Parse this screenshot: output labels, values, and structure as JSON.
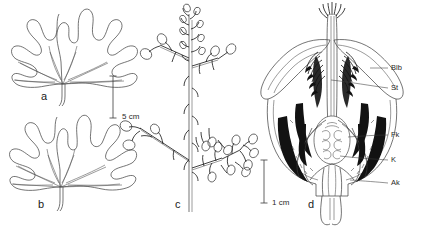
{
  "figure": {
    "kind": "botanical-line-drawing-plate",
    "background_color": "#ffffff",
    "ink_color": "#2a2a2a",
    "panels": [
      {
        "letter": "a",
        "subject": "palmate leaf with five broad blunt lobes",
        "letter_x": 41,
        "letter_y": 91
      },
      {
        "letter": "b",
        "subject": "palmate leaf with five narrow pointed lobes",
        "letter_x": 38,
        "letter_y": 199
      },
      {
        "letter": "c",
        "subject": "branched inflorescence panicle with flower buds",
        "letter_x": 175,
        "letter_y": 199
      },
      {
        "letter": "d",
        "subject": "longitudinal section of flower",
        "letter_x": 308,
        "letter_y": 199
      }
    ],
    "scale_bars": [
      {
        "label": "5 cm",
        "label_x": 122,
        "label_y": 113,
        "bar_x": 113,
        "bar_top": 76,
        "bar_bottom": 118,
        "applies_to": "a,b"
      },
      {
        "label": "1 cm",
        "label_x": 272,
        "label_y": 199,
        "bar_x": 264,
        "bar_top": 160,
        "bar_bottom": 203,
        "applies_to": "d"
      }
    ],
    "callouts": [
      {
        "label": "Blb",
        "text_x": 391,
        "text_y": 66,
        "leader_x1": 370,
        "leader_y1": 68,
        "leader_x2": 388,
        "leader_y2": 68
      },
      {
        "label": "St",
        "text_x": 391,
        "text_y": 86,
        "leader_x1": 331,
        "leader_y1": 80,
        "leader_x2": 388,
        "leader_y2": 88
      },
      {
        "label": "Fk",
        "text_x": 391,
        "text_y": 133,
        "leader_x1": 348,
        "leader_y1": 137,
        "leader_x2": 388,
        "leader_y2": 135
      },
      {
        "label": "K",
        "text_x": 391,
        "text_y": 158,
        "leader_x1": 340,
        "leader_y1": 156,
        "leader_x2": 388,
        "leader_y2": 160
      },
      {
        "label": "Ak",
        "text_x": 391,
        "text_y": 181,
        "leader_x1": 350,
        "leader_y1": 180,
        "leader_x2": 388,
        "leader_y2": 183
      }
    ]
  }
}
